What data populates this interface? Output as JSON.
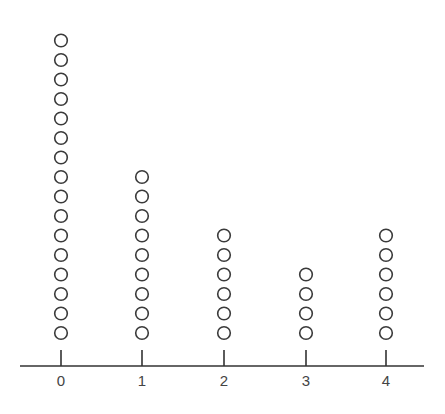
{
  "chart_data": {
    "type": "dot_plot",
    "title": "",
    "xlabel": "",
    "ylabel": "",
    "categories": [
      "0",
      "1",
      "2",
      "3",
      "4"
    ],
    "values": [
      16,
      9,
      6,
      4,
      6
    ],
    "marker": "open-circle",
    "grid": false,
    "legend": null,
    "colors": {
      "marker_stroke": "#3a3a3a",
      "axis": "#333333",
      "tick_label": "#444444",
      "background": "#ffffff"
    }
  },
  "axis": {
    "tick_labels": [
      "0",
      "1",
      "2",
      "3",
      "4"
    ]
  },
  "layout": {
    "x_positions": [
      61,
      142,
      224,
      306,
      386
    ],
    "axis_y": 366,
    "axis_x_start": 20,
    "axis_x_end": 424,
    "tick_top": 350,
    "label_y": 386,
    "dot_bottom_cy": 333,
    "dot_spacing": 19.5,
    "dot_radius": 6.3
  }
}
